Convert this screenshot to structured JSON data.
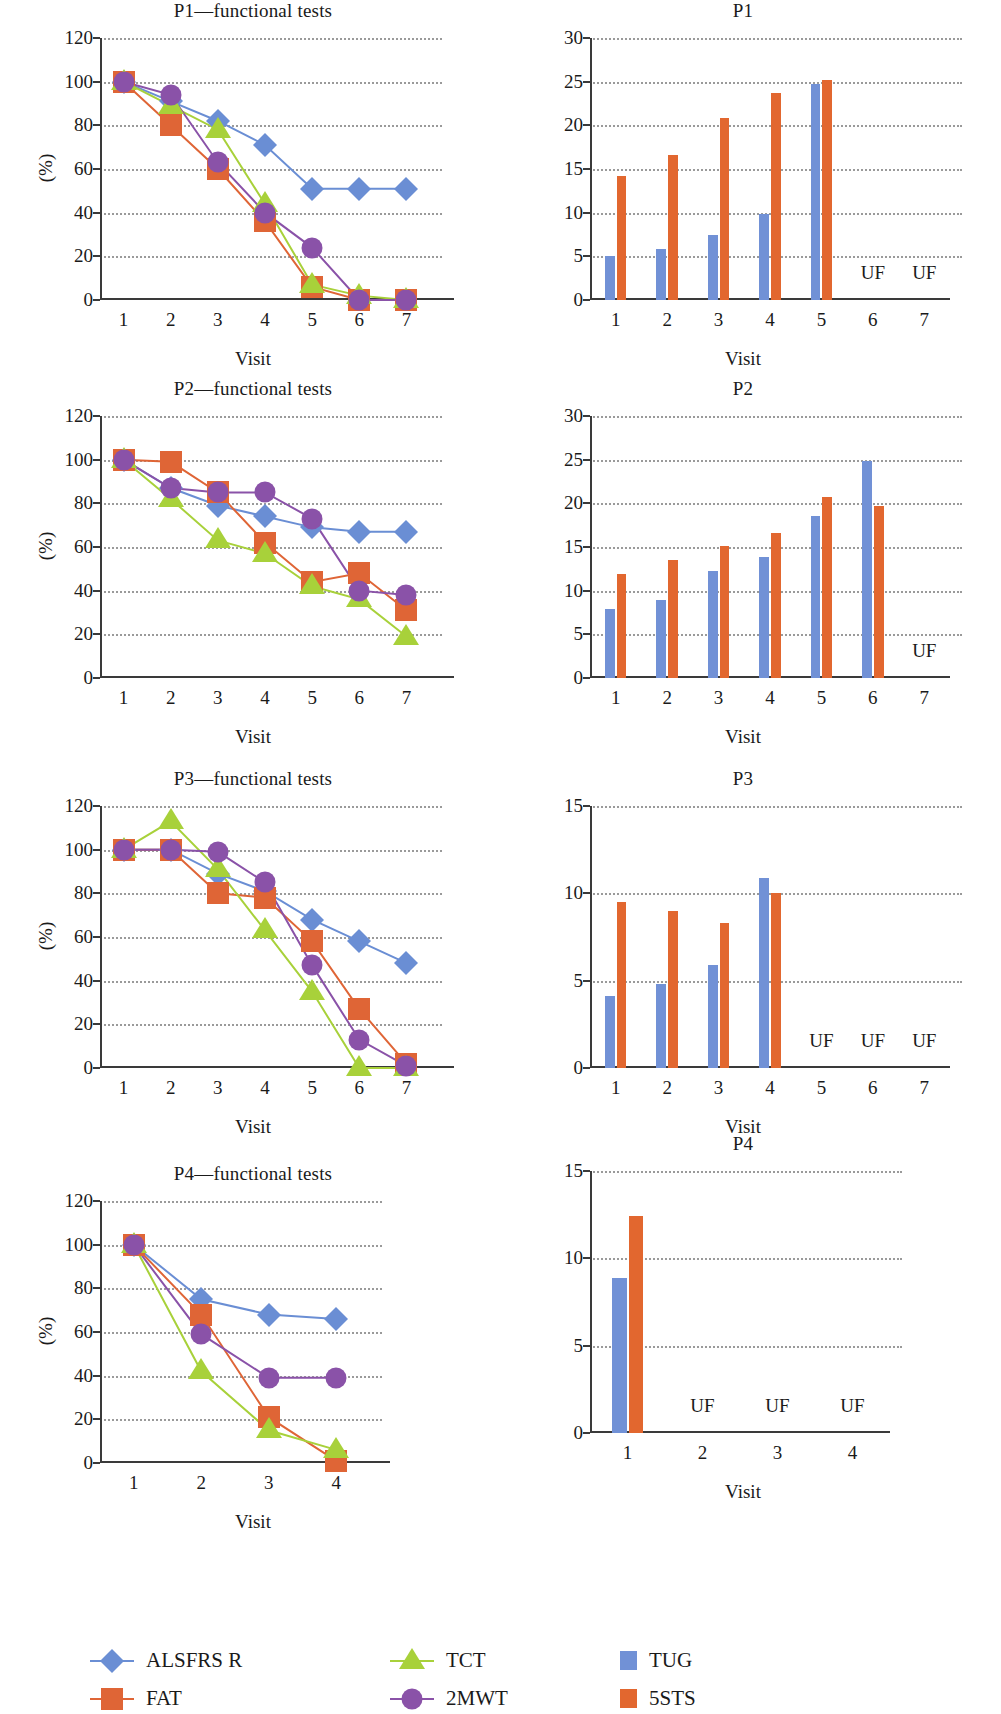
{
  "figure": {
    "xaxis_label": "Visit",
    "yaxis_label_percent": "(%)",
    "unfeasible_label": "UF"
  },
  "legend": {
    "items": [
      {
        "label": "ALSFRS R",
        "color": "#6a8ed4",
        "marker": "diamond",
        "kind": "line"
      },
      {
        "label": "FAT",
        "color": "#df6536",
        "marker": "square",
        "kind": "line"
      },
      {
        "label": "TCT",
        "color": "#a8d13a",
        "marker": "triangle",
        "kind": "line"
      },
      {
        "label": "2MWT",
        "color": "#8a52a8",
        "marker": "circle",
        "kind": "line"
      },
      {
        "label": "TUG",
        "color": "#7191d6",
        "marker": "swatch",
        "kind": "bar"
      },
      {
        "label": "5STS",
        "color": "#e2672f",
        "marker": "swatch",
        "kind": "bar"
      }
    ]
  },
  "chart_data": [
    {
      "id": "p1-functional",
      "type": "line",
      "title": "P1—functional tests",
      "xlabel": "Visit",
      "ylabel": "(%)",
      "x": [
        1,
        2,
        3,
        4,
        5,
        6,
        7
      ],
      "xticks": [
        "1",
        "2",
        "3",
        "4",
        "5",
        "6",
        "7"
      ],
      "yticks": [
        "0",
        "20",
        "40",
        "60",
        "80",
        "100",
        "120"
      ],
      "ylim": [
        0,
        120
      ],
      "grid": true,
      "series": [
        {
          "name": "ALSFRS R",
          "color": "#6a8ed4",
          "marker": "diamond",
          "values": [
            100,
            91,
            82,
            71,
            51,
            51,
            51
          ]
        },
        {
          "name": "FAT",
          "color": "#df6536",
          "marker": "square",
          "values": [
            100,
            80,
            60,
            36,
            6,
            0,
            0
          ]
        },
        {
          "name": "TCT",
          "color": "#a8d13a",
          "marker": "triangle",
          "values": [
            100,
            89,
            78,
            44,
            7,
            2,
            0
          ]
        },
        {
          "name": "2MWT",
          "color": "#8a52a8",
          "marker": "circle",
          "values": [
            100,
            94,
            63,
            40,
            24,
            0,
            0
          ]
        }
      ]
    },
    {
      "id": "p1-bars",
      "type": "bar",
      "title": "P1",
      "xlabel": "Visit",
      "categories": [
        "1",
        "2",
        "3",
        "4",
        "5",
        "6",
        "7"
      ],
      "yticks": [
        "0",
        "5",
        "10",
        "15",
        "20",
        "25",
        "30"
      ],
      "ylim": [
        0,
        30
      ],
      "grid": true,
      "series": [
        {
          "name": "TUG",
          "color": "#7191d6",
          "values": [
            5.0,
            5.8,
            7.4,
            9.8,
            24.7,
            null,
            null
          ]
        },
        {
          "name": "5STS",
          "color": "#e2672f",
          "values": [
            14.2,
            16.6,
            20.8,
            23.7,
            25.2,
            null,
            null
          ]
        }
      ],
      "unfeasible": [
        "6",
        "7"
      ]
    },
    {
      "id": "p2-functional",
      "type": "line",
      "title": "P2—functional tests",
      "xlabel": "Visit",
      "ylabel": "(%)",
      "x": [
        1,
        2,
        3,
        4,
        5,
        6,
        7
      ],
      "xticks": [
        "1",
        "2",
        "3",
        "4",
        "5",
        "6",
        "7"
      ],
      "yticks": [
        "0",
        "20",
        "40",
        "60",
        "80",
        "100",
        "120"
      ],
      "ylim": [
        0,
        120
      ],
      "grid": true,
      "series": [
        {
          "name": "ALSFRS R",
          "color": "#6a8ed4",
          "marker": "diamond",
          "values": [
            100,
            87,
            79,
            74,
            69,
            67,
            67
          ]
        },
        {
          "name": "FAT",
          "color": "#df6536",
          "marker": "square",
          "values": [
            100,
            99,
            85,
            62,
            44,
            48,
            31
          ]
        },
        {
          "name": "TCT",
          "color": "#a8d13a",
          "marker": "triangle",
          "values": [
            100,
            82,
            63,
            57,
            42,
            36,
            19
          ]
        },
        {
          "name": "2MWT",
          "color": "#8a52a8",
          "marker": "circle",
          "values": [
            100,
            87,
            85,
            85,
            73,
            40,
            38
          ]
        }
      ]
    },
    {
      "id": "p2-bars",
      "type": "bar",
      "title": "P2",
      "xlabel": "Visit",
      "categories": [
        "1",
        "2",
        "3",
        "4",
        "5",
        "6",
        "7"
      ],
      "yticks": [
        "0",
        "5",
        "10",
        "15",
        "20",
        "25",
        "30"
      ],
      "ylim": [
        0,
        30
      ],
      "grid": true,
      "series": [
        {
          "name": "TUG",
          "color": "#7191d6",
          "values": [
            7.9,
            8.9,
            12.2,
            13.9,
            18.6,
            24.9,
            null
          ]
        },
        {
          "name": "5STS",
          "color": "#e2672f",
          "values": [
            11.9,
            13.5,
            15.1,
            16.6,
            20.7,
            19.7,
            null
          ]
        }
      ],
      "unfeasible": [
        "7"
      ]
    },
    {
      "id": "p3-functional",
      "type": "line",
      "title": "P3—functional tests",
      "xlabel": "Visit",
      "ylabel": "(%)",
      "x": [
        1,
        2,
        3,
        4,
        5,
        6,
        7
      ],
      "xticks": [
        "1",
        "2",
        "3",
        "4",
        "5",
        "6",
        "7"
      ],
      "yticks": [
        "0",
        "20",
        "40",
        "60",
        "80",
        "100",
        "120"
      ],
      "ylim": [
        0,
        120
      ],
      "grid": true,
      "series": [
        {
          "name": "ALSFRS R",
          "color": "#6a8ed4",
          "marker": "diamond",
          "values": [
            100,
            100,
            89,
            81,
            68,
            58,
            48
          ]
        },
        {
          "name": "FAT",
          "color": "#df6536",
          "marker": "square",
          "values": [
            100,
            100,
            80,
            78,
            58,
            27,
            2
          ]
        },
        {
          "name": "TCT",
          "color": "#a8d13a",
          "marker": "triangle",
          "values": [
            100,
            113,
            91,
            63,
            35,
            0,
            0
          ]
        },
        {
          "name": "2MWT",
          "color": "#8a52a8",
          "marker": "circle",
          "values": [
            100,
            100,
            99,
            85,
            47,
            13,
            1
          ]
        }
      ]
    },
    {
      "id": "p3-bars",
      "type": "bar",
      "title": "P3",
      "xlabel": "Visit",
      "categories": [
        "1",
        "2",
        "3",
        "4",
        "5",
        "6",
        "7"
      ],
      "yticks": [
        "0",
        "5",
        "10",
        "15"
      ],
      "ylim": [
        0,
        15
      ],
      "grid": true,
      "series": [
        {
          "name": "TUG",
          "color": "#7191d6",
          "values": [
            4.1,
            4.8,
            5.9,
            10.9,
            null,
            null,
            null
          ]
        },
        {
          "name": "5STS",
          "color": "#e2672f",
          "values": [
            9.5,
            9.0,
            8.3,
            10.0,
            null,
            null,
            null
          ]
        }
      ],
      "unfeasible": [
        "5",
        "6",
        "7"
      ]
    },
    {
      "id": "p4-functional",
      "type": "line",
      "title": "P4—functional tests",
      "xlabel": "Visit",
      "ylabel": "(%)",
      "x": [
        1,
        2,
        3,
        4
      ],
      "xticks": [
        "1",
        "2",
        "3",
        "4"
      ],
      "yticks": [
        "0",
        "20",
        "40",
        "60",
        "80",
        "100",
        "120"
      ],
      "ylim": [
        0,
        120
      ],
      "grid": true,
      "series": [
        {
          "name": "ALSFRS R",
          "color": "#6a8ed4",
          "marker": "diamond",
          "values": [
            100,
            75,
            68,
            66
          ]
        },
        {
          "name": "FAT",
          "color": "#df6536",
          "marker": "square",
          "values": [
            100,
            68,
            21,
            1
          ]
        },
        {
          "name": "TCT",
          "color": "#a8d13a",
          "marker": "triangle",
          "values": [
            100,
            42,
            15,
            6
          ]
        },
        {
          "name": "2MWT",
          "color": "#8a52a8",
          "marker": "circle",
          "values": [
            100,
            59,
            39,
            39
          ]
        }
      ]
    },
    {
      "id": "p4-bars",
      "type": "bar",
      "title": "P4",
      "xlabel": "Visit",
      "categories": [
        "1",
        "2",
        "3",
        "4"
      ],
      "yticks": [
        "0",
        "5",
        "10",
        "15"
      ],
      "ylim": [
        0,
        15
      ],
      "grid": true,
      "series": [
        {
          "name": "TUG",
          "color": "#7191d6",
          "values": [
            8.9,
            null,
            null,
            null
          ]
        },
        {
          "name": "5STS",
          "color": "#e2672f",
          "values": [
            12.4,
            null,
            null,
            null
          ]
        }
      ],
      "unfeasible": [
        "2",
        "3",
        "4"
      ]
    }
  ]
}
